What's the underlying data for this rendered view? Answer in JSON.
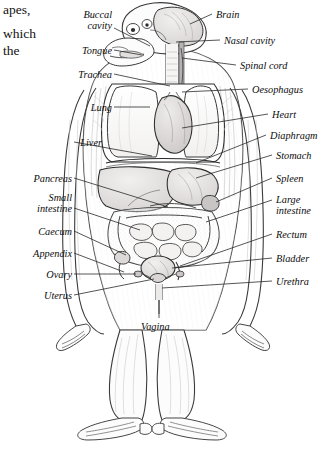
{
  "figure": {
    "kind": "anatomical-diagram",
    "style": "grayscale pen-and-ink line drawing with stipple shading",
    "body_text_fragments": [
      {
        "text": "apes,",
        "x": 3,
        "y": 3
      },
      {
        "text": "which",
        "x": 3,
        "y": 27
      },
      {
        "text": "the",
        "x": 3,
        "y": 44
      }
    ],
    "colors": {
      "ink": "#1a1a1a",
      "leader": "#2b2b2b",
      "organ_fill": "#e9e7e6",
      "organ_fill_dark": "#d8d5d4",
      "lung_fill": "#fbfbfb",
      "skin_fill": "#fcfbfa",
      "shade": "#bdbab9",
      "background": "#ffffff"
    }
  },
  "labels_left": [
    {
      "name": "buccal-cavity",
      "lines": [
        "Buccal",
        "cavity"
      ],
      "x": 56,
      "y": 10,
      "w": 56
    },
    {
      "name": "tongue",
      "lines": [
        "Tongue"
      ],
      "x": 52,
      "y": 46,
      "w": 60
    },
    {
      "name": "trachea",
      "lines": [
        "Trachea"
      ],
      "x": 40,
      "y": 70,
      "w": 72
    },
    {
      "name": "lung",
      "lines": [
        "Lung"
      ],
      "x": 36,
      "y": 103,
      "w": 76
    },
    {
      "name": "liver",
      "lines": [
        "Liver"
      ],
      "x": 30,
      "y": 138,
      "w": 72
    },
    {
      "name": "pancreas",
      "lines": [
        "Pancreas"
      ],
      "x": 4,
      "y": 174,
      "w": 68
    },
    {
      "name": "small-intestine",
      "lines": [
        "Small",
        "intestine"
      ],
      "x": 4,
      "y": 193,
      "w": 68
    },
    {
      "name": "caecum",
      "lines": [
        "Caecum"
      ],
      "x": 4,
      "y": 227,
      "w": 68
    },
    {
      "name": "appendix",
      "lines": [
        "Appendix"
      ],
      "x": 4,
      "y": 249,
      "w": 68
    },
    {
      "name": "ovary",
      "lines": [
        "Ovary"
      ],
      "x": 4,
      "y": 270,
      "w": 68
    },
    {
      "name": "uterus",
      "lines": [
        "Uterus"
      ],
      "x": 4,
      "y": 291,
      "w": 68
    }
  ],
  "labels_right": [
    {
      "name": "brain",
      "lines": [
        "Brain"
      ],
      "x": 216,
      "y": 10
    },
    {
      "name": "nasal-cavity",
      "lines": [
        "Nasal cavity"
      ],
      "x": 224,
      "y": 36
    },
    {
      "name": "spinal-cord",
      "lines": [
        "Spinal cord"
      ],
      "x": 240,
      "y": 61
    },
    {
      "name": "oesophagus",
      "lines": [
        "Oesophagus"
      ],
      "x": 252,
      "y": 85
    },
    {
      "name": "heart",
      "lines": [
        "Heart"
      ],
      "x": 272,
      "y": 110
    },
    {
      "name": "diaphragm",
      "lines": [
        "Diaphragm"
      ],
      "x": 270,
      "y": 131
    },
    {
      "name": "stomach",
      "lines": [
        "Stomach"
      ],
      "x": 276,
      "y": 151
    },
    {
      "name": "spleen",
      "lines": [
        "Spleen"
      ],
      "x": 276,
      "y": 174
    },
    {
      "name": "large-intestine",
      "lines": [
        "Large",
        "intestine"
      ],
      "x": 276,
      "y": 195
    },
    {
      "name": "rectum",
      "lines": [
        "Rectum"
      ],
      "x": 276,
      "y": 230
    },
    {
      "name": "bladder",
      "lines": [
        "Bladder"
      ],
      "x": 276,
      "y": 254
    },
    {
      "name": "urethra",
      "lines": [
        "Urethra"
      ],
      "x": 276,
      "y": 277
    }
  ],
  "labels_bottom": [
    {
      "name": "vagina",
      "lines": [
        "Vagina"
      ],
      "x": 141,
      "y": 322
    }
  ]
}
